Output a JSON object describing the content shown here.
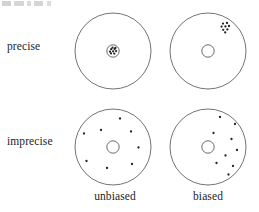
{
  "figure": {
    "title_artifact": "",
    "row_labels": [
      {
        "id": "precise",
        "text": "precise"
      },
      {
        "id": "imprecise",
        "text": "imprecise"
      }
    ],
    "column_labels": [
      {
        "id": "unbiased",
        "text": "unbiased"
      },
      {
        "id": "biased",
        "text": "biased"
      }
    ],
    "colors": {
      "background": "#ffffff",
      "ring_stroke": "#5a5a5a",
      "center_ring_stroke": "#4f4f4f",
      "dot_fill": "#242424",
      "label_text": "#1d1d1d"
    },
    "geometry": {
      "outer_radius": 38,
      "center_ring_radius": 6.2,
      "dot_radius": 1.15,
      "panel_center_x": 43,
      "panel_center_y": 45
    }
  },
  "chart_data": {
    "type": "scatter",
    "xlabel": "bias",
    "ylabel": "precision",
    "grid": false,
    "legend": "none",
    "row_categories": [
      "precise",
      "imprecise"
    ],
    "column_categories": [
      "unbiased",
      "biased"
    ],
    "panels": [
      {
        "id": "precise-unbiased",
        "row": "precise",
        "column": "unbiased",
        "description": "tight cluster centred on the target",
        "target_center": [
          43,
          45
        ],
        "target_radius": 38,
        "center_ring_radius": 6.2,
        "cluster_center": [
          43,
          45
        ],
        "spread": "tight",
        "n_points": 9,
        "points": [
          [
            41.2,
            43.2
          ],
          [
            44.6,
            43.0
          ],
          [
            39.9,
            45.6
          ],
          [
            43.1,
            45.3
          ],
          [
            46.1,
            45.1
          ],
          [
            41.0,
            47.4
          ],
          [
            44.3,
            47.6
          ],
          [
            42.5,
            41.6
          ],
          [
            45.4,
            41.9
          ]
        ]
      },
      {
        "id": "precise-biased",
        "row": "precise",
        "column": "biased",
        "description": "tight cluster offset to the upper right of the target",
        "target_center": [
          43,
          45
        ],
        "target_radius": 38,
        "center_ring_radius": 6.2,
        "cluster_center": [
          61,
          21
        ],
        "spread": "tight",
        "n_points": 8,
        "points": [
          [
            58.0,
            17.6
          ],
          [
            62.0,
            17.0
          ],
          [
            56.6,
            20.6
          ],
          [
            60.4,
            20.4
          ],
          [
            64.0,
            20.0
          ],
          [
            58.2,
            23.8
          ],
          [
            62.4,
            23.4
          ],
          [
            60.2,
            26.4
          ]
        ]
      },
      {
        "id": "imprecise-unbiased",
        "row": "imprecise",
        "column": "unbiased",
        "description": "widely scattered shots spread evenly around the target centre",
        "target_center": [
          43,
          45
        ],
        "target_radius": 38,
        "center_ring_radius": 6.2,
        "cluster_center": [
          43,
          45
        ],
        "spread": "wide",
        "n_points": 8,
        "points": [
          [
            50.0,
            16.5
          ],
          [
            31.0,
            28.0
          ],
          [
            14.0,
            31.5
          ],
          [
            61.0,
            29.5
          ],
          [
            68.5,
            45.5
          ],
          [
            16.5,
            59.0
          ],
          [
            37.0,
            66.0
          ],
          [
            62.0,
            62.0
          ]
        ]
      },
      {
        "id": "imprecise-biased",
        "row": "imprecise",
        "column": "biased",
        "description": "widely scattered shots displaced toward the right of the target",
        "target_center": [
          43,
          45
        ],
        "target_radius": 38,
        "center_ring_radius": 6.2,
        "cluster_center": [
          62,
          48
        ],
        "spread": "wide",
        "n_points": 9,
        "points": [
          [
            55.0,
            15.0
          ],
          [
            70.0,
            22.0
          ],
          [
            48.5,
            31.0
          ],
          [
            66.5,
            37.0
          ],
          [
            72.0,
            48.0
          ],
          [
            60.5,
            53.5
          ],
          [
            51.5,
            61.0
          ],
          [
            68.0,
            64.0
          ],
          [
            63.5,
            72.5
          ]
        ]
      }
    ]
  }
}
